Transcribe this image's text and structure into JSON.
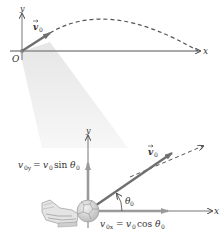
{
  "figure": {
    "top_panel": {
      "axis_x_label": "x",
      "axis_y_label": "y",
      "origin_label": "O",
      "velocity_label": "v",
      "velocity_subscript": "0",
      "trajectory": "dashed parabola"
    },
    "bottom_panel": {
      "axis_x_label": "x",
      "axis_y_label": "y",
      "velocity_label": "v",
      "velocity_subscript": "0",
      "angle_label": "θ",
      "angle_subscript": "0",
      "vy_component": {
        "lhs": "v",
        "lhs_sub": "0y",
        "eq": " = ",
        "rhs": "v",
        "rhs_sub": "0",
        "func": " sin ",
        "theta": "θ",
        "theta_sub": "0"
      },
      "vx_component": {
        "lhs": "v",
        "lhs_sub": "0x",
        "eq": " = ",
        "rhs": "v",
        "rhs_sub": "0",
        "func": " cos ",
        "theta": "θ",
        "theta_sub": "0"
      },
      "object": "soccer ball kicked by shoe"
    },
    "colors": {
      "axis": "#8c8c8c",
      "vector": "#6f6f6f",
      "component": "#9a9a9a",
      "cone": "#ededed",
      "text": "#333333",
      "dash": "#555555"
    }
  }
}
